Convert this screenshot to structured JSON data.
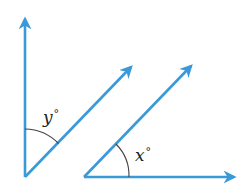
{
  "diagram": {
    "type": "angle-relationship",
    "colors": {
      "ray": "#3a9ad9",
      "arc": "#444444",
      "label": "#222222"
    },
    "angles": [
      {
        "id": "y",
        "variable": "y",
        "degree_symbol": "°",
        "label": "y°",
        "vertex": [
          25,
          177
        ],
        "rays": [
          "vertical-up",
          "diagonal-up-right"
        ]
      },
      {
        "id": "x",
        "variable": "x",
        "degree_symbol": "°",
        "label": "x°",
        "vertex": [
          84,
          177
        ],
        "rays": [
          "diagonal-up-right",
          "horizontal-right"
        ]
      }
    ],
    "rays": [
      {
        "id": "left-vertical",
        "from": [
          25,
          177
        ],
        "to": [
          25,
          16
        ]
      },
      {
        "id": "left-diagonal",
        "from": [
          25,
          177
        ],
        "to": [
          133,
          65
        ]
      },
      {
        "id": "right-diagonal",
        "from": [
          84,
          177
        ],
        "to": [
          193,
          64
        ]
      },
      {
        "id": "right-horizontal",
        "from": [
          84,
          177
        ],
        "to": [
          237,
          177
        ]
      }
    ],
    "note": "The two diagonal rays are parallel."
  }
}
